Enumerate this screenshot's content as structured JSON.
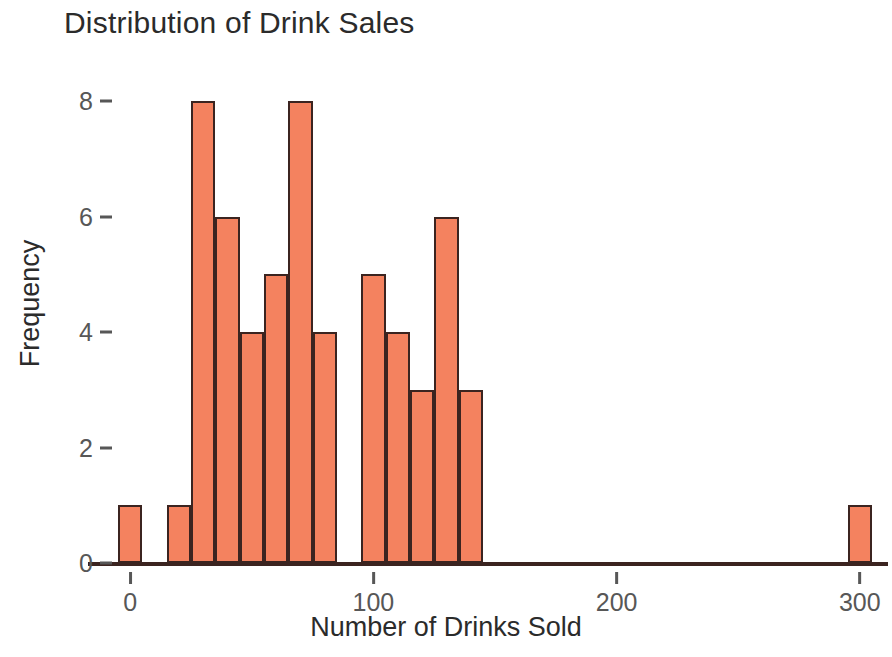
{
  "chart_data": {
    "type": "bar",
    "title": "Distribution of Drink Sales",
    "xlabel": "Number of Drinks Sold",
    "ylabel": "Frequency",
    "xlim": [
      -5,
      305
    ],
    "ylim": [
      0,
      8.4
    ],
    "grid": false,
    "legend": null,
    "bin_width": 10,
    "x_ticks": [
      {
        "value": 0,
        "label": "0"
      },
      {
        "value": 100,
        "label": "100"
      },
      {
        "value": 200,
        "label": "200"
      },
      {
        "value": 300,
        "label": "300"
      }
    ],
    "y_ticks": [
      {
        "value": 0,
        "label": "0"
      },
      {
        "value": 2,
        "label": "2"
      },
      {
        "value": 4,
        "label": "4"
      },
      {
        "value": 6,
        "label": "6"
      },
      {
        "value": 8,
        "label": "8"
      }
    ],
    "bars": [
      {
        "bin_start": -5,
        "bin_end": 5,
        "value": 1
      },
      {
        "bin_start": 15,
        "bin_end": 25,
        "value": 1
      },
      {
        "bin_start": 25,
        "bin_end": 35,
        "value": 8
      },
      {
        "bin_start": 35,
        "bin_end": 45,
        "value": 6
      },
      {
        "bin_start": 45,
        "bin_end": 55,
        "value": 4
      },
      {
        "bin_start": 55,
        "bin_end": 65,
        "value": 5
      },
      {
        "bin_start": 65,
        "bin_end": 75,
        "value": 8
      },
      {
        "bin_start": 75,
        "bin_end": 85,
        "value": 4
      },
      {
        "bin_start": 95,
        "bin_end": 105,
        "value": 5
      },
      {
        "bin_start": 105,
        "bin_end": 115,
        "value": 4
      },
      {
        "bin_start": 115,
        "bin_end": 125,
        "value": 3
      },
      {
        "bin_start": 125,
        "bin_end": 135,
        "value": 6
      },
      {
        "bin_start": 135,
        "bin_end": 145,
        "value": 3
      },
      {
        "bin_start": 295,
        "bin_end": 305,
        "value": 1
      }
    ],
    "colors": {
      "bar_fill": "#F4825F",
      "bar_edge": "#3b2420",
      "axis": "#575757",
      "text": "#2b2b2b",
      "background": "#ffffff"
    }
  }
}
